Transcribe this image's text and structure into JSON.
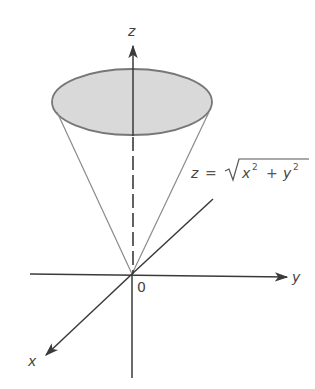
{
  "figure": {
    "colors": {
      "axis": "#3a3a3a",
      "cone_edge": "#8a8a8a",
      "top_fill": "#d9d9d9",
      "top_stroke": "#777777",
      "text": "#444444"
    },
    "labels": {
      "z_axis": "z",
      "y_axis": "y",
      "x_axis": "x",
      "origin": "0"
    },
    "equation": {
      "lhs": "z",
      "equals": "=",
      "radical": "√",
      "term1_base": "x",
      "term1_exp": "2",
      "plus": "+",
      "term2_base": "y",
      "term2_exp": "2"
    }
  }
}
